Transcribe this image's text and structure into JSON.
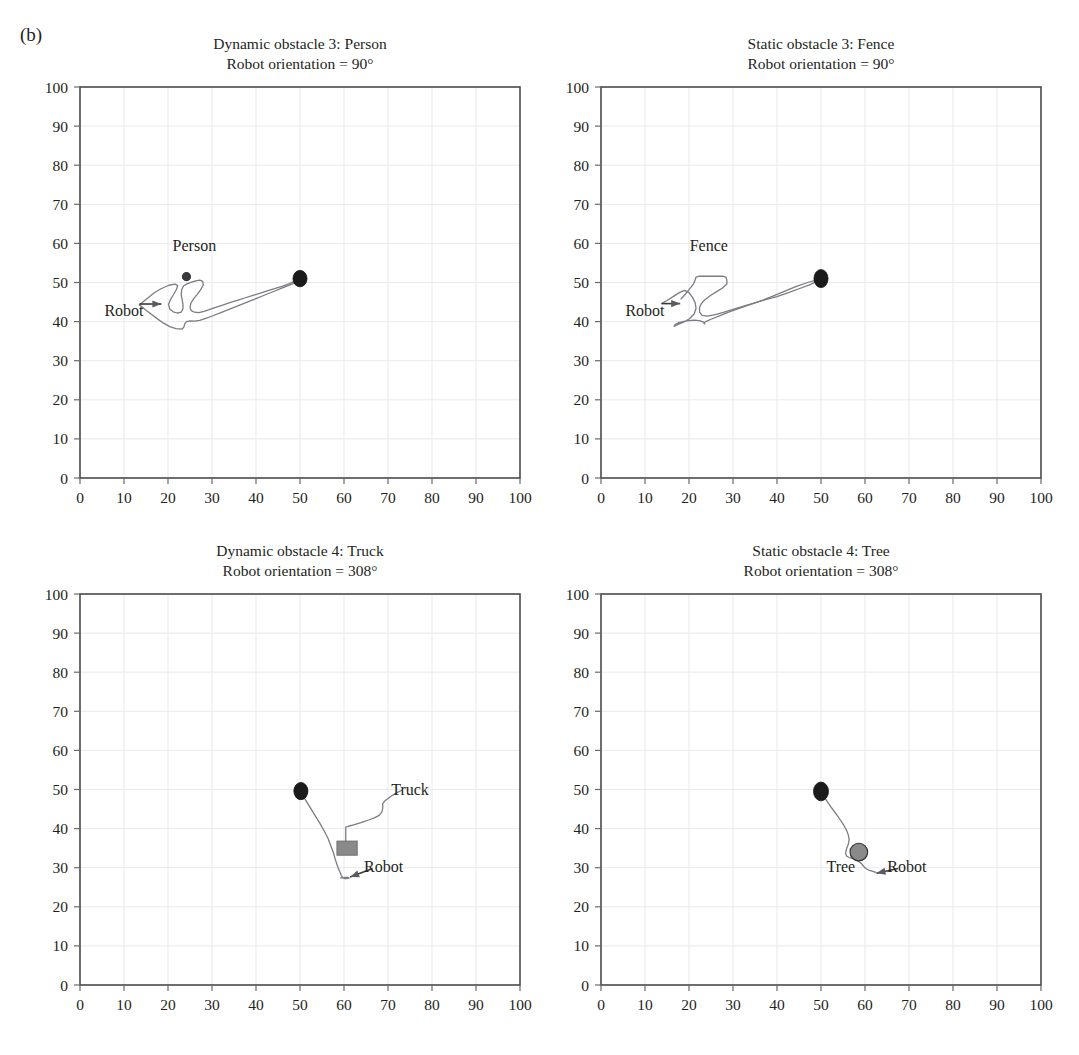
{
  "figure": {
    "panel_label": "(b)",
    "background": "#ffffff",
    "axis_color": "#4a4a4a",
    "grid_color": "#e9e9ef",
    "trajectory_color": "#7c7c82",
    "marker_color": "#1b1b1b",
    "obstacle_fill": "#8a8a8a"
  },
  "axis": {
    "x_ticks": [
      0,
      10,
      20,
      30,
      40,
      50,
      60,
      70,
      80,
      90,
      100
    ],
    "y_ticks": [
      0,
      10,
      20,
      30,
      40,
      50,
      60,
      70,
      80,
      90,
      100
    ],
    "xlim": [
      0,
      100
    ],
    "ylim": [
      0,
      100
    ],
    "grid": true,
    "xlabel": "",
    "ylabel": ""
  },
  "chart_data": [
    {
      "id": "dynamic-obstacle-3-person",
      "type": "line",
      "title": "Dynamic obstacle 3: Person",
      "subtitle": "Robot orientation = 90°",
      "xlabel": "",
      "ylabel": "",
      "xlim": [
        0,
        100
      ],
      "ylim": [
        0,
        100
      ],
      "grid": true,
      "annotations": [
        {
          "label": "Person",
          "x": 26,
          "y": 58
        },
        {
          "label": "Robot",
          "x": 10,
          "y": 41.5
        }
      ],
      "markers": [
        {
          "name": "goal-marker",
          "shape": "ellipse",
          "x": 50,
          "y": 51,
          "rx": 1.6,
          "ry": 2.1,
          "fill": "#1b1b1b"
        },
        {
          "name": "person-marker",
          "shape": "circle",
          "x": 24.2,
          "y": 51.5,
          "r": 0.9,
          "fill": "#3a3a3a"
        }
      ],
      "robot_arrow": {
        "x1": 13.5,
        "y1": 44.5,
        "x2": 18.5,
        "y2": 44.5
      },
      "series": [
        {
          "name": "robot-path",
          "x": [
            13.5,
            15.5,
            16.8,
            18.4,
            20.2,
            21.6,
            22.2,
            21.9,
            21.3,
            20.6,
            20.1,
            20.4,
            21.2,
            22.1,
            23.0,
            23.4,
            23.4,
            23.2,
            23.0,
            23.1,
            23.5,
            24.4,
            25.4,
            26.3,
            27.2,
            27.9,
            28.0,
            27.4,
            26.6,
            25.8,
            25.2,
            25.0,
            25.3,
            26.0,
            27.0,
            28.2,
            29.5,
            31.0,
            32.6,
            34.2,
            35.9,
            37.6,
            39.3,
            41.0,
            42.7,
            44.4,
            46.1,
            47.6,
            48.9,
            50.0
          ],
          "y": [
            44.3,
            46.1,
            47.3,
            48.4,
            49.3,
            49.6,
            49.2,
            48.2,
            47.0,
            45.7,
            44.4,
            43.2,
            42.5,
            42.2,
            42.4,
            43.3,
            44.5,
            45.7,
            46.9,
            48.1,
            49.1,
            49.7,
            50.1,
            50.4,
            50.6,
            50.3,
            49.3,
            48.1,
            46.9,
            45.8,
            44.7,
            43.6,
            42.8,
            42.4,
            42.3,
            42.6,
            43.1,
            43.7,
            44.3,
            44.9,
            45.5,
            46.1,
            46.7,
            47.3,
            47.9,
            48.5,
            49.1,
            49.7,
            50.4,
            51.0
          ]
        },
        {
          "name": "robot-path-lower",
          "x": [
            13.5,
            14.8,
            16.2,
            17.6,
            19.0,
            20.4,
            21.8,
            23.2,
            23.6,
            23.8,
            24.2,
            25.0,
            26.0,
            27.2,
            28.6,
            30.2,
            32.0,
            34.0,
            36.0,
            38.0,
            40.0,
            42.0,
            44.0,
            46.0,
            48.0,
            50.0
          ],
          "y": [
            44.3,
            43.1,
            41.9,
            40.7,
            39.6,
            38.7,
            38.2,
            38.1,
            38.6,
            39.4,
            40.0,
            40.2,
            40.1,
            40.3,
            40.8,
            41.5,
            42.3,
            43.2,
            44.1,
            45.0,
            45.9,
            46.8,
            47.7,
            48.6,
            49.5,
            50.4
          ]
        }
      ]
    },
    {
      "id": "static-obstacle-3-fence",
      "type": "line",
      "title": "Static obstacle 3: Fence",
      "subtitle": "Robot orientation = 90°",
      "xlabel": "",
      "ylabel": "",
      "xlim": [
        0,
        100
      ],
      "ylim": [
        0,
        100
      ],
      "grid": true,
      "annotations": [
        {
          "label": "Fence",
          "x": 24.5,
          "y": 58
        },
        {
          "label": "Robot",
          "x": 10,
          "y": 41.5
        }
      ],
      "markers": [
        {
          "name": "goal-marker",
          "shape": "ellipse",
          "x": 50,
          "y": 51,
          "rx": 1.6,
          "ry": 2.3,
          "fill": "#1b1b1b"
        }
      ],
      "robot_arrow": {
        "x1": 13.8,
        "y1": 44.6,
        "x2": 18.0,
        "y2": 44.6
      },
      "series": [
        {
          "name": "robot-path-upper",
          "x": [
            18.2,
            19.0,
            20.0,
            21.0,
            21.4,
            21.6,
            22.4,
            23.6,
            25.0,
            26.4,
            27.6,
            28.4,
            28.6,
            28.6,
            27.6,
            26.2,
            24.8,
            23.6,
            22.8,
            22.4,
            22.4,
            23.0,
            24.2,
            26.0,
            28.0,
            30.2,
            32.6,
            35.0,
            37.4,
            40.0,
            42.6,
            45.0,
            47.4,
            49.6
          ],
          "y": [
            45.8,
            46.8,
            48.2,
            49.6,
            50.6,
            51.4,
            51.6,
            51.6,
            51.6,
            51.6,
            51.6,
            51.4,
            50.6,
            49.6,
            48.6,
            47.6,
            46.6,
            45.6,
            44.6,
            43.6,
            42.4,
            41.6,
            41.4,
            41.8,
            42.4,
            43.2,
            44.0,
            44.8,
            45.6,
            46.4,
            47.4,
            48.4,
            49.4,
            50.6
          ]
        },
        {
          "name": "robot-path-lower",
          "x": [
            13.8,
            15.0,
            16.4,
            17.8,
            19.0,
            20.0,
            20.8,
            21.4,
            21.6,
            21.2,
            20.2,
            19.0,
            17.8,
            17.0,
            16.6,
            16.8,
            17.8,
            19.4,
            21.2,
            22.6,
            23.4,
            23.6,
            23.4,
            23.8,
            25.0,
            26.8,
            29.0,
            31.4,
            34.0,
            36.6,
            39.2,
            41.8,
            44.4,
            47.0,
            49.4
          ],
          "y": [
            44.6,
            45.4,
            46.4,
            47.4,
            48.0,
            47.4,
            46.2,
            44.8,
            43.4,
            42.0,
            40.8,
            40.0,
            39.4,
            39.0,
            38.8,
            39.2,
            39.8,
            40.2,
            40.4,
            40.2,
            39.8,
            39.4,
            39.6,
            40.0,
            40.6,
            41.4,
            42.4,
            43.4,
            44.4,
            45.4,
            46.6,
            47.8,
            49.0,
            50.0,
            50.8
          ]
        }
      ]
    },
    {
      "id": "dynamic-obstacle-4-truck",
      "type": "line",
      "title": "Dynamic obstacle 4: Truck",
      "subtitle": "Robot orientation = 308°",
      "xlabel": "",
      "ylabel": "",
      "xlim": [
        0,
        100
      ],
      "ylim": [
        0,
        100
      ],
      "grid": true,
      "annotations": [
        {
          "label": "Truck",
          "x": 75,
          "y": 48.5
        },
        {
          "label": "Robot",
          "x": 69,
          "y": 29
        }
      ],
      "markers": [
        {
          "name": "start-marker",
          "shape": "ellipse",
          "x": 50.2,
          "y": 49.6,
          "rx": 1.6,
          "ry": 2.2,
          "fill": "#1b1b1b"
        },
        {
          "name": "truck-obstacle",
          "shape": "rect",
          "x": 58.4,
          "y": 33.2,
          "w": 4.6,
          "h": 3.6,
          "fill": "#8a8a8a"
        }
      ],
      "robot_arrow": {
        "x1": 66.5,
        "y1": 29.8,
        "x2": 61.4,
        "y2": 27.6
      },
      "series": [
        {
          "name": "robot-path",
          "x": [
            50.2,
            51.0,
            52.2,
            53.4,
            54.6,
            55.6,
            56.4,
            57.0,
            57.6,
            58.0,
            58.4,
            58.8,
            59.2,
            59.4,
            59.6,
            59.8,
            60.2,
            60.6,
            61.0,
            61.2,
            60.8,
            60.2,
            59.6,
            59.2
          ],
          "y": [
            49.6,
            47.8,
            45.6,
            43.4,
            41.2,
            39.2,
            37.4,
            35.6,
            33.8,
            32.2,
            30.8,
            29.6,
            28.6,
            28.0,
            27.6,
            27.4,
            27.2,
            27.2,
            27.3,
            27.4,
            27.5,
            27.5,
            27.4,
            27.4
          ]
        },
        {
          "name": "truck-path",
          "x": [
            60.4,
            60.4,
            60.4,
            60.4,
            60.4,
            61.0,
            62.4,
            64.0,
            65.6,
            67.0,
            68.0,
            68.6,
            68.8,
            68.8,
            69.4,
            70.6,
            72.0,
            73.2
          ],
          "y": [
            34.0,
            35.6,
            37.2,
            38.8,
            40.4,
            40.6,
            41.0,
            41.6,
            42.2,
            42.8,
            43.4,
            44.2,
            45.2,
            46.4,
            47.2,
            48.2,
            49.2,
            49.8
          ]
        }
      ]
    },
    {
      "id": "static-obstacle-4-tree",
      "type": "line",
      "title": "Static obstacle 4: Tree",
      "subtitle": "Robot orientation = 308°",
      "xlabel": "",
      "ylabel": "",
      "xlim": [
        0,
        100
      ],
      "ylim": [
        0,
        100
      ],
      "grid": true,
      "annotations": [
        {
          "label": "Tree",
          "x": 54.5,
          "y": 29
        },
        {
          "label": "Robot",
          "x": 69.5,
          "y": 29
        }
      ],
      "markers": [
        {
          "name": "start-marker",
          "shape": "ellipse",
          "x": 50.0,
          "y": 49.5,
          "rx": 1.7,
          "ry": 2.4,
          "fill": "#1b1b1b"
        },
        {
          "name": "tree-obstacle",
          "shape": "circle",
          "x": 58.6,
          "y": 34.0,
          "r": 2.0,
          "fill": "#8a8a8a"
        }
      ],
      "robot_arrow": {
        "x1": 67.5,
        "y1": 29.8,
        "x2": 62.6,
        "y2": 28.6
      },
      "series": [
        {
          "name": "robot-path",
          "x": [
            50.0,
            51.0,
            52.2,
            53.4,
            54.4,
            55.2,
            55.8,
            56.2,
            56.4,
            56.2,
            55.8,
            55.6,
            55.8,
            56.4,
            57.2,
            58.0,
            58.8,
            59.4,
            59.8,
            60.2,
            60.8,
            61.4,
            62.0,
            62.4
          ],
          "y": [
            49.5,
            47.6,
            45.6,
            43.8,
            42.2,
            40.8,
            39.6,
            38.4,
            37.2,
            36.0,
            34.8,
            33.8,
            33.0,
            32.6,
            32.4,
            32.0,
            31.4,
            30.8,
            30.2,
            29.8,
            29.4,
            29.2,
            29.0,
            28.8
          ]
        }
      ]
    }
  ]
}
